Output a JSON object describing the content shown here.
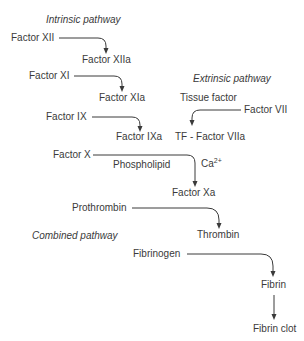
{
  "diagram": {
    "headers": {
      "intrinsic": "Intrinsic pathway",
      "extrinsic": "Extrinsic pathway",
      "combined": "Combined pathway"
    },
    "nodes": {
      "factor_xii": "Factor XII",
      "factor_xiia": "Factor XIIa",
      "factor_xi": "Factor XI",
      "factor_xia": "Factor XIa",
      "factor_ix": "Factor IX",
      "factor_ixa": "Factor IXa",
      "tissue_factor": "Tissue factor",
      "factor_vii": "Factor VII",
      "tf_factor_viia": "TF - Factor VIIa",
      "factor_x": "Factor X",
      "phospholipid": "Phospholipid",
      "ca_base": "Ca",
      "ca_sup": "2+",
      "factor_xa": "Factor Xa",
      "prothrombin": "Prothrombin",
      "thrombin": "Thrombin",
      "fibrinogen": "Fibrinogen",
      "fibrin": "Fibrin",
      "fibrin_clot": "Fibrin clot"
    },
    "edges": [
      {
        "from": "Factor XII",
        "to": "Factor XIIa"
      },
      {
        "from": "Factor XI",
        "to": "Factor XIa"
      },
      {
        "from": "Factor IX",
        "to": "Factor IXa"
      },
      {
        "from": "Factor VII",
        "to": "TF - Factor VIIa"
      },
      {
        "from": "Factor X",
        "to": "Factor Xa"
      },
      {
        "from": "Prothrombin",
        "to": "Thrombin"
      },
      {
        "from": "Fibrinogen",
        "to": "Fibrin"
      },
      {
        "from": "Fibrin",
        "to": "Fibrin clot"
      }
    ],
    "colors": {
      "text": "#3a3a3a",
      "line": "#3a3a3a",
      "background": "#ffffff"
    }
  }
}
